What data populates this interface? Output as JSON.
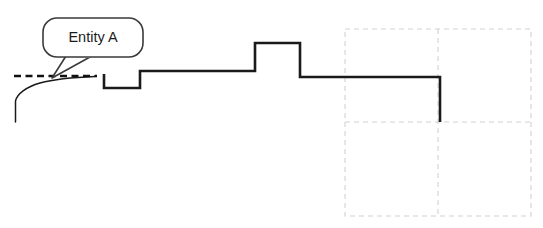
{
  "diagram": {
    "background_color": "#ffffff",
    "callout": {
      "label": "Entity A",
      "text_color": "#1c1c1c",
      "fill_color": "#ffffff",
      "border_color": "#3a3a3a",
      "border_width": 1.6,
      "x": 43,
      "y": 18,
      "width": 100,
      "height": 39,
      "corner_radius": 14,
      "tail_points": "66,56 90,57 52,78",
      "text_x": 93,
      "text_y": 38
    },
    "dashed_reference_line": {
      "name": "dashed-reference-line",
      "color": "#111111",
      "width": 2.6,
      "dash_pattern": "7,4.5",
      "x1": 14,
      "y1": 76,
      "x2": 97,
      "y2": 76
    },
    "thin_curve": {
      "name": "thin-curve",
      "color": "#1a1a1a",
      "width": 1.5,
      "path": "M 15.5 122 L 15.5 101 C 17 94 26 87 40 83 C 56 78.5 78 77 95 76.4"
    },
    "step_profile": {
      "name": "step-profile-line",
      "color": "#1a1a1a",
      "width": 2.6,
      "path": "M 104 74 L 104 88 L 140 88 L 140 71 L 255 71 L 255 43 L 300 43 L 300 77 L 440 77 L 440 122",
      "vertices": [
        {
          "x": 104,
          "y": 74
        },
        {
          "x": 104,
          "y": 88
        },
        {
          "x": 140,
          "y": 88
        },
        {
          "x": 140,
          "y": 71
        },
        {
          "x": 255,
          "y": 71
        },
        {
          "x": 255,
          "y": 43
        },
        {
          "x": 300,
          "y": 43
        },
        {
          "x": 300,
          "y": 77
        },
        {
          "x": 440,
          "y": 77
        },
        {
          "x": 440,
          "y": 122
        }
      ]
    },
    "grid": {
      "name": "dashed-grid",
      "color": "#d2d2d2",
      "width": 1.1,
      "dash_pattern": "5,4",
      "left": 345,
      "top": 29,
      "right": 531,
      "bottom": 216,
      "column_divider_x": 438,
      "row_divider_y": 122,
      "columns": 2,
      "rows": 2
    }
  }
}
